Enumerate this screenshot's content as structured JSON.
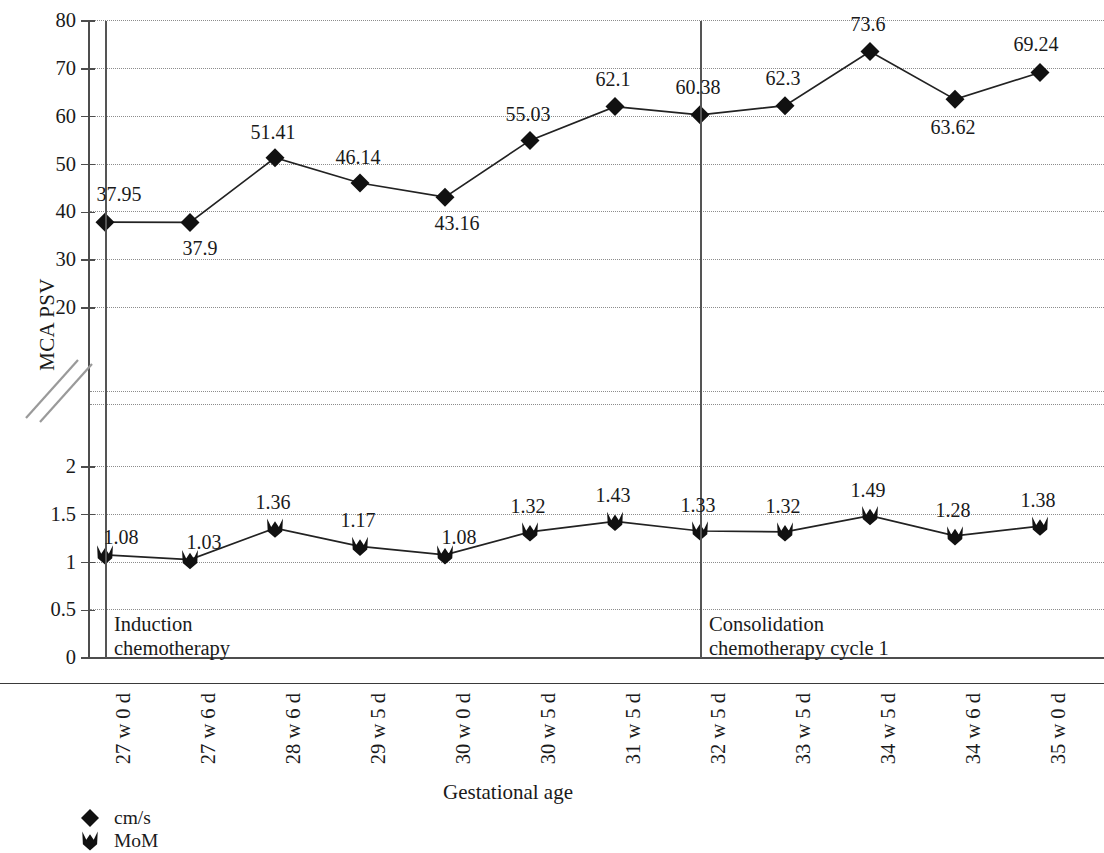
{
  "chart_data": {
    "type": "line",
    "title": "",
    "xlabel": "Gestational age",
    "ylabel": "MCA PSV",
    "axis_break": true,
    "grid": true,
    "legend_position": "bottom-left",
    "categories": [
      "27 w 0 d",
      "27 w 6 d",
      "28 w 6 d",
      "29 w 5 d",
      "30 w 0 d",
      "30 w 5 d",
      "31 w 5 d",
      "32 w 5 d",
      "33 w 5 d",
      "34 w 5 d",
      "34 w 6 d",
      "35 w 0 d"
    ],
    "y_upper_ticks": [
      "80",
      "70",
      "60",
      "50",
      "40",
      "30",
      "20"
    ],
    "y_lower_ticks": [
      "2",
      "1.5",
      "1",
      "0.5",
      "0"
    ],
    "ylim_upper": [
      20,
      80
    ],
    "ylim_lower": [
      0,
      2
    ],
    "series": [
      {
        "name": "cm/s",
        "marker": "diamond",
        "axis": "upper",
        "values": [
          37.95,
          37.9,
          51.41,
          46.14,
          43.16,
          55.03,
          62.1,
          60.38,
          62.3,
          73.6,
          63.62,
          69.24
        ],
        "labels": [
          "37.95",
          "37.9",
          "51.41",
          "46.14",
          "43.16",
          "55.03",
          "62.1",
          "60.38",
          "62.3",
          "73.6",
          "63.62",
          "69.24"
        ]
      },
      {
        "name": "MoM",
        "marker": "shield",
        "axis": "lower",
        "values": [
          1.08,
          1.03,
          1.36,
          1.17,
          1.08,
          1.32,
          1.43,
          1.33,
          1.32,
          1.49,
          1.28,
          1.38
        ],
        "labels": [
          "1.08",
          "1.03",
          "1.36",
          "1.17",
          "1.08",
          "1.32",
          "1.43",
          "1.33",
          "1.32",
          "1.49",
          "1.28",
          "1.38"
        ]
      }
    ],
    "annotations": [
      {
        "id": "induction",
        "line1": "Induction",
        "line2": "chemotherapy",
        "at_category": "27 w 0 d"
      },
      {
        "id": "consolidation",
        "line1": "Consolidation",
        "line2": "chemotherapy cycle 1",
        "at_category": "32 w 5 d"
      }
    ]
  },
  "axis": {
    "y_title": "MCA PSV",
    "x_title": "Gestational age"
  },
  "legend": {
    "items": [
      {
        "label": "cm/s",
        "marker": "diamond-marker-icon"
      },
      {
        "label": "MoM",
        "marker": "shield-marker-icon"
      }
    ]
  },
  "colors": {
    "ink": "#1a1a1a",
    "axis": "#4d4d4d",
    "grid": "#8c8c8c",
    "marker": "#111111"
  }
}
